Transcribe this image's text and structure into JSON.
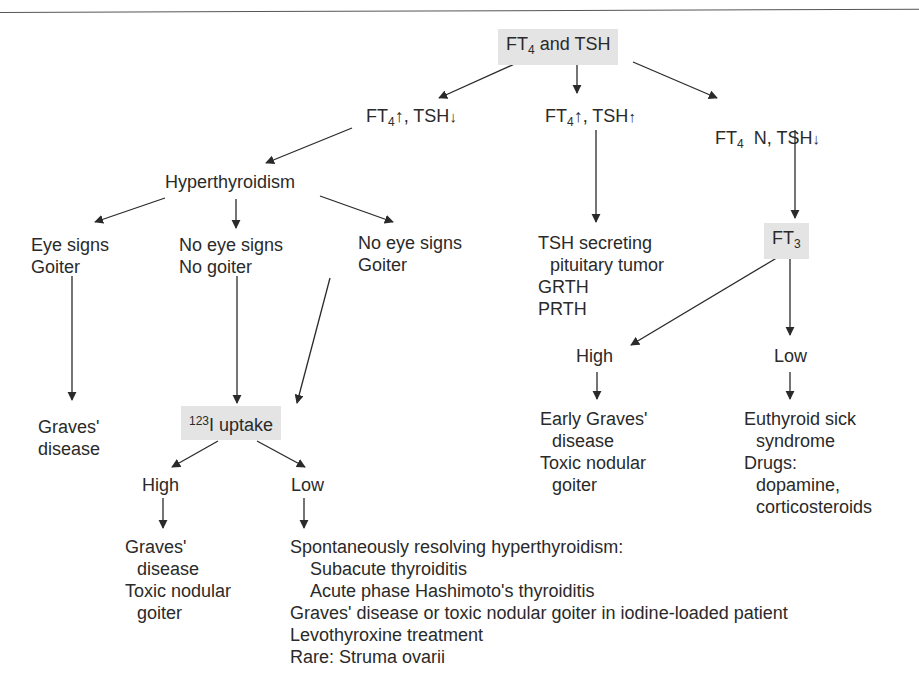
{
  "diagram": {
    "root": {
      "label_pre": "FT",
      "label_sub": "4",
      "label_post": " and TSH"
    },
    "branch_left": {
      "pre": "FT",
      "sub": "4",
      "mid": "↑, TSH",
      "post": "↓"
    },
    "branch_mid": {
      "pre": "FT",
      "sub": "4",
      "mid": "↑, TSH",
      "post": "↑"
    },
    "branch_right": {
      "pre": "FT",
      "sub": "4",
      "mid": "  N, TSH",
      "post": "↓"
    },
    "hyperthyroidism": "Hyperthyroidism",
    "eye_goiter": [
      "Eye signs",
      "Goiter"
    ],
    "noeye_nogoiter": [
      "No eye signs",
      "No goiter"
    ],
    "noeye_goiter": [
      "No eye signs",
      "Goiter"
    ],
    "graves_left": [
      "Graves'",
      "disease"
    ],
    "uptake": {
      "sup": "123",
      "label": "I uptake"
    },
    "uptake_high": "High",
    "uptake_low": "Low",
    "uptake_high_result": [
      "Graves'",
      "disease",
      "Toxic nodular",
      "goiter"
    ],
    "uptake_low_result": [
      "Spontaneously resolving hyperthyroidism:",
      "Subacute thyroiditis",
      "Acute phase Hashimoto's thyroiditis",
      "Graves' disease or toxic nodular goiter in iodine-loaded patient",
      "Levothyroxine treatment",
      "Rare: Struma ovarii"
    ],
    "tsh_result": [
      "TSH secreting",
      "pituitary tumor",
      "GRTH",
      "PRTH"
    ],
    "ft3": {
      "pre": "FT",
      "sub": "3"
    },
    "ft3_high": "High",
    "ft3_low": "Low",
    "ft3_high_result": [
      "Early Graves'",
      "disease",
      "Toxic nodular",
      "goiter"
    ],
    "ft3_low_result": [
      "Euthyroid sick",
      "syndrome",
      "Drugs:",
      "dopamine,",
      "corticosteroids"
    ]
  },
  "colors": {
    "box_fill": "#e4e4e4",
    "line": "#2a2a2a"
  }
}
